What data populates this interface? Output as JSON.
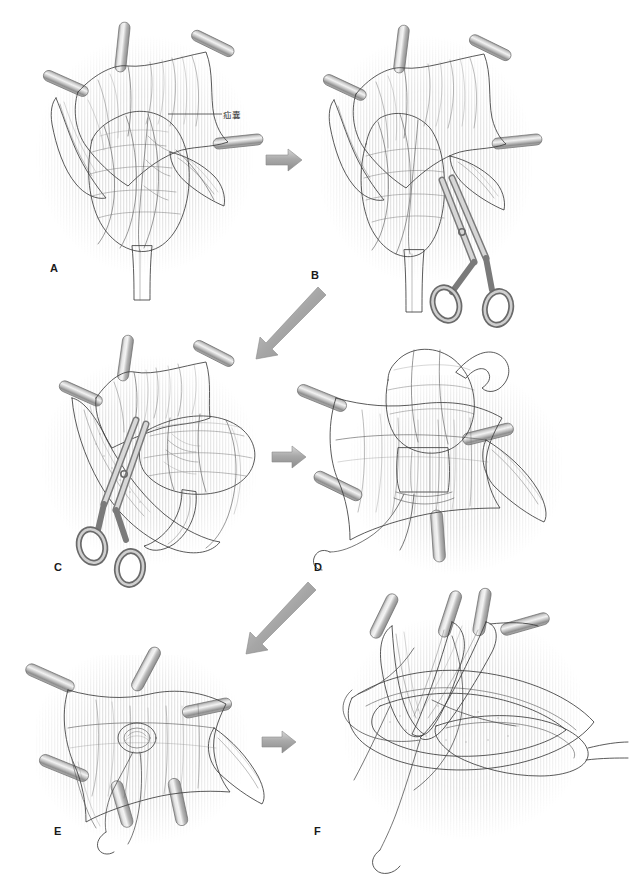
{
  "figure": {
    "background_color": "#ffffff",
    "line_color": "#3c3c3c",
    "arrow_color": "#9a9a9a",
    "instrument_color": "#b8b8b8",
    "panels": [
      {
        "id": "A",
        "letter": "A",
        "caption": "",
        "annotations": [
          {
            "text": "疝囊",
            "role": "hernia-sac-label"
          }
        ],
        "clamps": 4,
        "instruments": []
      },
      {
        "id": "B",
        "letter": "B",
        "caption": "",
        "annotations": [],
        "clamps": 4,
        "instruments": [
          "scissors"
        ]
      },
      {
        "id": "C",
        "letter": "C",
        "caption": "",
        "annotations": [],
        "clamps": 3,
        "instruments": [
          "scissors"
        ]
      },
      {
        "id": "D",
        "letter": "D",
        "caption": "",
        "annotations": [],
        "clamps": 4,
        "instruments": [
          "needle",
          "suture"
        ]
      },
      {
        "id": "E",
        "letter": "E",
        "caption": "",
        "annotations": [],
        "clamps": 6,
        "instruments": [
          "needle",
          "suture"
        ]
      },
      {
        "id": "F",
        "letter": "F",
        "caption": "",
        "annotations": [],
        "clamps": 4,
        "instruments": [
          "needle",
          "suture"
        ]
      }
    ],
    "arrows": [
      {
        "id": "arrow-a-b",
        "from": "A",
        "to": "B",
        "direction": "right"
      },
      {
        "id": "arrow-b-c",
        "from": "B",
        "to": "C",
        "direction": "down-left"
      },
      {
        "id": "arrow-c-d",
        "from": "C",
        "to": "D",
        "direction": "right"
      },
      {
        "id": "arrow-d-e",
        "from": "D",
        "to": "E",
        "direction": "down-left"
      },
      {
        "id": "arrow-e-f",
        "from": "E",
        "to": "F",
        "direction": "right"
      }
    ]
  }
}
